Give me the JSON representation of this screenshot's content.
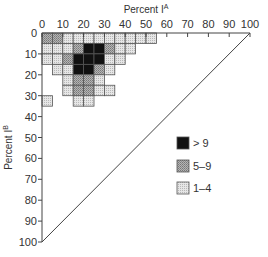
{
  "chart_data": {
    "type": "heatmap",
    "title": "",
    "xlabel": "Percent I^A",
    "ylabel": "Percent I^B",
    "xlim": [
      0,
      100
    ],
    "ylim": [
      0,
      100
    ],
    "x_ticks": [
      0,
      10,
      20,
      30,
      40,
      50,
      60,
      70,
      80,
      90,
      100
    ],
    "y_ticks": [
      0,
      10,
      20,
      30,
      40,
      50,
      60,
      70,
      80,
      90,
      100
    ],
    "x_axis_position": "top",
    "y_axis_inverted": true,
    "cell_size": 5,
    "diagonal_line": {
      "from": [
        100,
        0
      ],
      "to": [
        0,
        100
      ]
    },
    "legend": {
      "position": "lower-right",
      "entries": [
        {
          "label": "> 9",
          "category": "high",
          "color": "#111111"
        },
        {
          "label": "5–9",
          "category": "mid",
          "color": "#9a9a9a"
        },
        {
          "label": "1–4",
          "category": "low",
          "color": "#d6d6d6"
        }
      ]
    },
    "cells": [
      {
        "x": 0,
        "y": 0,
        "cat": "mid"
      },
      {
        "x": 5,
        "y": 0,
        "cat": "mid"
      },
      {
        "x": 10,
        "y": 0,
        "cat": "low"
      },
      {
        "x": 15,
        "y": 0,
        "cat": "low"
      },
      {
        "x": 20,
        "y": 0,
        "cat": "low"
      },
      {
        "x": 25,
        "y": 0,
        "cat": "low"
      },
      {
        "x": 30,
        "y": 0,
        "cat": "low"
      },
      {
        "x": 35,
        "y": 0,
        "cat": "low"
      },
      {
        "x": 40,
        "y": 0,
        "cat": "low"
      },
      {
        "x": 45,
        "y": 0,
        "cat": "low"
      },
      {
        "x": 50,
        "y": 0,
        "cat": "low"
      },
      {
        "x": 0,
        "y": 5,
        "cat": "low"
      },
      {
        "x": 5,
        "y": 5,
        "cat": "low"
      },
      {
        "x": 10,
        "y": 5,
        "cat": "low"
      },
      {
        "x": 15,
        "y": 5,
        "cat": "mid"
      },
      {
        "x": 20,
        "y": 5,
        "cat": "high"
      },
      {
        "x": 25,
        "y": 5,
        "cat": "high"
      },
      {
        "x": 30,
        "y": 5,
        "cat": "mid"
      },
      {
        "x": 35,
        "y": 5,
        "cat": "low"
      },
      {
        "x": 40,
        "y": 5,
        "cat": "low"
      },
      {
        "x": 0,
        "y": 10,
        "cat": "low"
      },
      {
        "x": 5,
        "y": 10,
        "cat": "low"
      },
      {
        "x": 10,
        "y": 10,
        "cat": "mid"
      },
      {
        "x": 15,
        "y": 10,
        "cat": "high"
      },
      {
        "x": 20,
        "y": 10,
        "cat": "high"
      },
      {
        "x": 25,
        "y": 10,
        "cat": "high"
      },
      {
        "x": 30,
        "y": 10,
        "cat": "low"
      },
      {
        "x": 35,
        "y": 10,
        "cat": "low"
      },
      {
        "x": 5,
        "y": 15,
        "cat": "low"
      },
      {
        "x": 10,
        "y": 15,
        "cat": "low"
      },
      {
        "x": 15,
        "y": 15,
        "cat": "high"
      },
      {
        "x": 20,
        "y": 15,
        "cat": "high"
      },
      {
        "x": 25,
        "y": 15,
        "cat": "mid"
      },
      {
        "x": 30,
        "y": 15,
        "cat": "low"
      },
      {
        "x": 10,
        "y": 20,
        "cat": "low"
      },
      {
        "x": 15,
        "y": 20,
        "cat": "mid"
      },
      {
        "x": 20,
        "y": 20,
        "cat": "mid"
      },
      {
        "x": 25,
        "y": 20,
        "cat": "low"
      },
      {
        "x": 10,
        "y": 25,
        "cat": "low"
      },
      {
        "x": 15,
        "y": 25,
        "cat": "mid"
      },
      {
        "x": 20,
        "y": 25,
        "cat": "mid"
      },
      {
        "x": 25,
        "y": 25,
        "cat": "low"
      },
      {
        "x": 30,
        "y": 25,
        "cat": "low"
      },
      {
        "x": 0,
        "y": 30,
        "cat": "low"
      },
      {
        "x": 15,
        "y": 30,
        "cat": "low"
      },
      {
        "x": 20,
        "y": 30,
        "cat": "low"
      }
    ]
  },
  "axes": {
    "x_title": "Percent I",
    "x_title_sup": "A",
    "y_title": "Percent I",
    "y_title_sup": "B"
  },
  "legend": {
    "high_label": "> 9",
    "mid_label": "5–9",
    "low_label": "1–4"
  }
}
